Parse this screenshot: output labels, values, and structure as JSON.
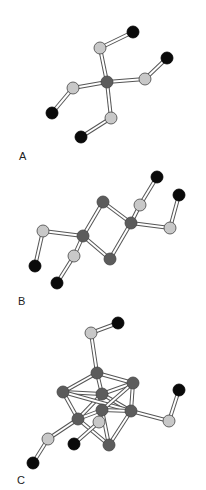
{
  "colors": {
    "background": "#ffffff",
    "metal_atom": "#5c5c5c",
    "light_atom": "#c8c8c8",
    "black_atom": "#0a0a0a",
    "bond_outline": "#555555",
    "bond_fill": "#ffffff"
  },
  "panels": [
    {
      "label": "A",
      "label_pos": [
        19,
        150
      ],
      "atoms": [
        {
          "x": 107,
          "y": 82,
          "type": "metal_atom"
        },
        {
          "x": 100,
          "y": 48,
          "type": "light_atom"
        },
        {
          "x": 133,
          "y": 32,
          "type": "black_atom"
        },
        {
          "x": 145,
          "y": 79,
          "type": "light_atom"
        },
        {
          "x": 167,
          "y": 58,
          "type": "black_atom"
        },
        {
          "x": 73,
          "y": 88,
          "type": "light_atom"
        },
        {
          "x": 52,
          "y": 113,
          "type": "black_atom"
        },
        {
          "x": 111,
          "y": 118,
          "type": "light_atom"
        },
        {
          "x": 81,
          "y": 137,
          "type": "black_atom"
        }
      ],
      "bonds": [
        [
          0,
          1
        ],
        [
          1,
          2
        ],
        [
          0,
          3
        ],
        [
          3,
          4
        ],
        [
          0,
          5
        ],
        [
          5,
          6
        ],
        [
          0,
          7
        ],
        [
          7,
          8
        ]
      ]
    },
    {
      "label": "B",
      "label_pos": [
        18,
        295
      ],
      "atoms": [
        {
          "x": 103,
          "y": 202,
          "type": "metal_atom"
        },
        {
          "x": 83,
          "y": 236,
          "type": "metal_atom"
        },
        {
          "x": 110,
          "y": 259,
          "type": "metal_atom"
        },
        {
          "x": 131,
          "y": 223,
          "type": "metal_atom"
        },
        {
          "x": 140,
          "y": 205,
          "type": "light_atom"
        },
        {
          "x": 157,
          "y": 177,
          "type": "black_atom"
        },
        {
          "x": 170,
          "y": 228,
          "type": "light_atom"
        },
        {
          "x": 179,
          "y": 195,
          "type": "black_atom"
        },
        {
          "x": 43,
          "y": 231,
          "type": "light_atom"
        },
        {
          "x": 35,
          "y": 266,
          "type": "black_atom"
        },
        {
          "x": 74,
          "y": 256,
          "type": "light_atom"
        },
        {
          "x": 57,
          "y": 283,
          "type": "black_atom"
        }
      ],
      "bonds": [
        [
          0,
          1
        ],
        [
          1,
          2
        ],
        [
          2,
          3
        ],
        [
          3,
          0
        ],
        [
          3,
          4
        ],
        [
          4,
          5
        ],
        [
          3,
          6
        ],
        [
          6,
          7
        ],
        [
          1,
          8
        ],
        [
          8,
          9
        ],
        [
          1,
          10
        ],
        [
          10,
          11
        ]
      ]
    },
    {
      "label": "C",
      "label_pos": [
        17,
        474
      ],
      "atoms": [
        {
          "x": 97,
          "y": 373,
          "type": "metal_atom"
        },
        {
          "x": 133,
          "y": 383,
          "type": "metal_atom"
        },
        {
          "x": 63,
          "y": 392,
          "type": "metal_atom"
        },
        {
          "x": 102,
          "y": 394,
          "type": "metal_atom"
        },
        {
          "x": 102,
          "y": 410,
          "type": "metal_atom"
        },
        {
          "x": 131,
          "y": 411,
          "type": "metal_atom"
        },
        {
          "x": 78,
          "y": 419,
          "type": "metal_atom"
        },
        {
          "x": 109,
          "y": 445,
          "type": "metal_atom"
        },
        {
          "x": 91,
          "y": 333,
          "type": "light_atom"
        },
        {
          "x": 118,
          "y": 323,
          "type": "black_atom"
        },
        {
          "x": 99,
          "y": 422,
          "type": "light_atom"
        },
        {
          "x": 74,
          "y": 444,
          "type": "black_atom"
        },
        {
          "x": 169,
          "y": 421,
          "type": "light_atom"
        },
        {
          "x": 179,
          "y": 390,
          "type": "black_atom"
        },
        {
          "x": 48,
          "y": 439,
          "type": "light_atom"
        },
        {
          "x": 33,
          "y": 463,
          "type": "black_atom"
        }
      ],
      "bonds": [
        [
          0,
          1
        ],
        [
          0,
          2
        ],
        [
          0,
          3
        ],
        [
          1,
          3
        ],
        [
          1,
          5
        ],
        [
          2,
          3
        ],
        [
          2,
          6
        ],
        [
          3,
          5
        ],
        [
          3,
          6
        ],
        [
          2,
          5
        ],
        [
          4,
          6
        ],
        [
          4,
          5
        ],
        [
          4,
          7
        ],
        [
          6,
          7
        ],
        [
          5,
          7
        ],
        [
          1,
          4
        ],
        [
          0,
          8
        ],
        [
          8,
          9
        ],
        [
          4,
          10
        ],
        [
          10,
          11
        ],
        [
          5,
          12
        ],
        [
          12,
          13
        ],
        [
          6,
          14
        ],
        [
          14,
          15
        ]
      ]
    }
  ]
}
